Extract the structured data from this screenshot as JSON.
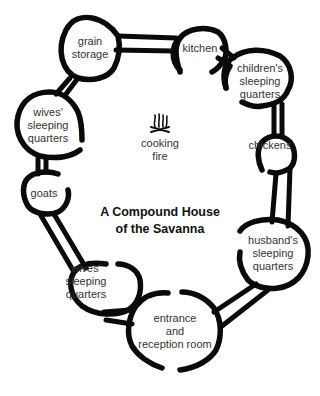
{
  "title": {
    "line1": "A Compound House",
    "line2": "of the Savanna"
  },
  "center": {
    "icon": "fire-icon",
    "line1": "cooking",
    "line2": "fire"
  },
  "rooms": [
    {
      "id": "grain-storage",
      "lines": [
        "grain",
        "storage"
      ]
    },
    {
      "id": "kitchen",
      "lines": [
        "kitchen"
      ]
    },
    {
      "id": "childrens-sleeping-quarters",
      "lines": [
        "children's",
        "sleeping",
        "quarters"
      ]
    },
    {
      "id": "chickens",
      "lines": [
        "chickens"
      ]
    },
    {
      "id": "husbands-sleeping-quarters",
      "lines": [
        "husband's",
        "sleeping",
        "quarters"
      ]
    },
    {
      "id": "entrance-reception-room",
      "lines": [
        "entrance",
        "and",
        "reception room"
      ]
    },
    {
      "id": "wives-sleeping-quarters-lower",
      "lines": [
        "wives'",
        "sleeping",
        "quarters"
      ]
    },
    {
      "id": "goats",
      "lines": [
        "goats"
      ]
    },
    {
      "id": "wives-sleeping-quarters-upper",
      "lines": [
        "wives'",
        "sleeping",
        "quarters"
      ]
    }
  ],
  "colors": {
    "ink": "#0a0a0a",
    "text": "#333333",
    "background": "#ffffff"
  }
}
